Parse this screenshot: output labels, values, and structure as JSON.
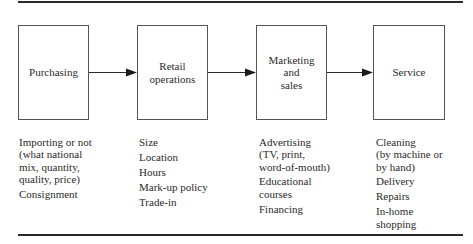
{
  "diagram": {
    "type": "process-flow",
    "stages": [
      {
        "label": "Purchasing",
        "details": [
          "Importing or not\n(what national\nmix, quantity,\nquality, price)",
          "Consignment"
        ]
      },
      {
        "label": "Retail\noperations",
        "details": [
          "Size",
          "Location",
          "Hours",
          "Mark-up policy",
          "Trade-in"
        ]
      },
      {
        "label": "Marketing\nand\nsales",
        "details": [
          "Advertising\n(TV, print,\nword-of-mouth)",
          "Educational\ncourses",
          "Financing"
        ]
      },
      {
        "label": "Service",
        "details": [
          "Cleaning\n(by machine or\nby hand)",
          "Delivery",
          "Repairs",
          "In-home\nshopping"
        ]
      }
    ],
    "connections": [
      {
        "from": "Purchasing",
        "to": "Retail operations"
      },
      {
        "from": "Retail operations",
        "to": "Marketing and sales"
      },
      {
        "from": "Marketing and sales",
        "to": "Service"
      }
    ],
    "colors": {
      "line": "#2a2a2a",
      "box_border": "#555555",
      "text": "#2a2a2a",
      "background": "#ffffff"
    }
  }
}
